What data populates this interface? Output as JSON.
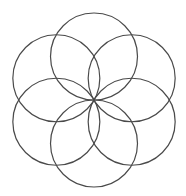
{
  "diagram": {
    "type": "flower-of-life-6-petal",
    "circle_count": 6,
    "stroke_color": "#4a4a4a",
    "background_color": "#ffffff",
    "angles_deg": [
      90,
      30,
      -30,
      -90,
      -150,
      150
    ]
  }
}
